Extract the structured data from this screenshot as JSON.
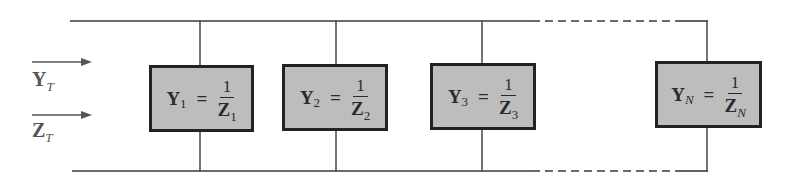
{
  "diagram": {
    "type": "parallel admittance network",
    "inputs": [
      {
        "var": "Y",
        "sub": "T",
        "arrow": "right"
      },
      {
        "var": "Z",
        "sub": "T",
        "arrow": "right"
      }
    ],
    "elements": [
      {
        "lhs_var": "Y",
        "lhs_sub": "1",
        "equals": "=",
        "num": "1",
        "den_var": "Z",
        "den_sub": "1"
      },
      {
        "lhs_var": "Y",
        "lhs_sub": "2",
        "equals": "=",
        "num": "1",
        "den_var": "Z",
        "den_sub": "2"
      },
      {
        "lhs_var": "Y",
        "lhs_sub": "3",
        "equals": "=",
        "num": "1",
        "den_var": "Z",
        "den_sub": "3"
      },
      {
        "lhs_var": "Y",
        "lhs_sub": "N",
        "equals": "=",
        "num": "1",
        "den_var": "Z",
        "den_sub": "N"
      }
    ],
    "colors": {
      "box_fill": "#bdbdbd",
      "box_border": "#222222",
      "wire": "#3a3a3a",
      "arrow": "#555555"
    }
  }
}
